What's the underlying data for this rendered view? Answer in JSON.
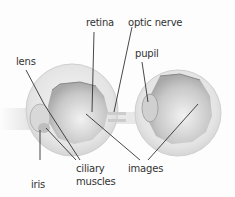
{
  "labels": {
    "retina": "retina",
    "optic_nerve": "optic nerve",
    "lens": "lens",
    "pupil": "pupil",
    "iris": "iris",
    "ciliary": "ciliary",
    "muscles": "muscles",
    "images": "images"
  },
  "colors": {
    "background": "#fdfdfd",
    "eye_outer": "#e6e6e6",
    "eye_inner": "#cfcfcf",
    "leader_line": "#333333",
    "text": "#333333"
  }
}
